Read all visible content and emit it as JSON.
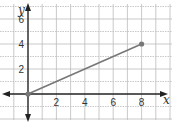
{
  "chart_data": {
    "type": "line",
    "title": "",
    "xlabel": "x",
    "ylabel": "y",
    "xlim": [
      -2,
      10
    ],
    "ylim": [
      -3,
      7
    ],
    "grid": true,
    "x_ticks": [
      2,
      4,
      6,
      8
    ],
    "y_ticks": [
      2,
      4,
      6
    ],
    "series": [
      {
        "name": "segment",
        "points": [
          [
            0,
            0
          ],
          [
            8,
            4
          ]
        ]
      }
    ],
    "colors": {
      "line": "#777777",
      "axis": "#222222",
      "grid": "#bbbbbb"
    }
  }
}
